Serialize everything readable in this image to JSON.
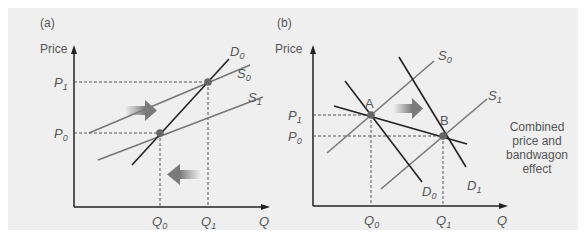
{
  "figure": {
    "background": "#efefef",
    "axis_color": "#222222",
    "supply_color": "#777777",
    "demand_color": "#222222",
    "point_color": "#666666",
    "arrow_color": "#888888"
  },
  "panel_a": {
    "label": "(a)",
    "y_axis": "Price",
    "x_axis": "Q",
    "p1": "P",
    "p1_sub": "1",
    "p0": "P",
    "p0_sub": "0",
    "q0": "Q",
    "q0_sub": "0",
    "q1": "Q",
    "q1_sub": "1",
    "d0": "D",
    "d0_sub": "0",
    "s0": "S",
    "s0_sub": "0",
    "s1": "S",
    "s1_sub": "1"
  },
  "panel_b": {
    "label": "(b)",
    "y_axis": "Price",
    "x_axis": "Q",
    "p1": "P",
    "p1_sub": "1",
    "p0": "P",
    "p0_sub": "0",
    "q0": "Q",
    "q0_sub": "0",
    "q1": "Q",
    "q1_sub": "1",
    "s0": "S",
    "s0_sub": "0",
    "s1": "S",
    "s1_sub": "1",
    "d0": "D",
    "d0_sub": "0",
    "d1": "D",
    "d1_sub": "1",
    "point_a": "A",
    "point_b": "B",
    "annotation_line1": "Combined",
    "annotation_line2": "price and",
    "annotation_line3": "bandwagon",
    "annotation_line4": "effect"
  }
}
